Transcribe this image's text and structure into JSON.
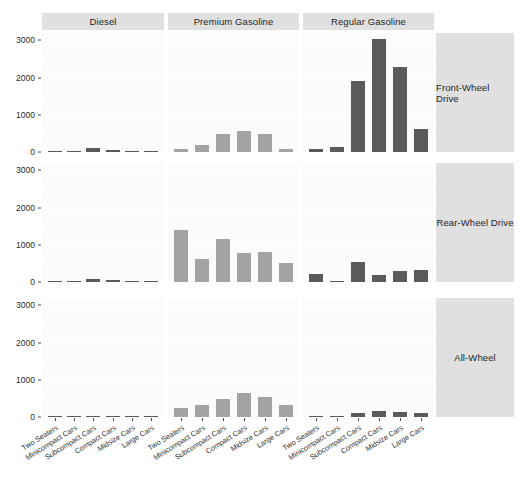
{
  "chart_data": {
    "type": "bar",
    "title": "",
    "xlabel": "",
    "ylabel": "",
    "ylim": [
      0,
      3200
    ],
    "grid": true,
    "legend_position": "none",
    "ytick_labels": [
      "3000",
      "2000",
      "1000",
      "0"
    ],
    "ytick_values": [
      3000,
      2000,
      1000,
      0
    ],
    "categories": [
      "Two Seaters",
      "Minicompact Cars",
      "Subcompact Cars",
      "Compact Cars",
      "Midsize Cars",
      "Large Cars"
    ],
    "col_facets": [
      "Diesel",
      "Premium Gasoline",
      "Regular Gasoline"
    ],
    "row_facets": [
      "Front-Wheel Drive",
      "Rear-Wheel Drive",
      "All-Wheel"
    ],
    "colors": {
      "bar_light": "#a3a3a3",
      "bar_dark": "#5a5a5a",
      "panel_background": "#fbfbfb",
      "strip_background": "#e0e0e0",
      "gridline": "#ffffff",
      "text": "#1f1f1f"
    },
    "panels": [
      {
        "row": "Front-Wheel Drive",
        "col": "Diesel",
        "color": "bar_dark",
        "values": [
          0,
          40,
          120,
          45,
          15,
          0
        ]
      },
      {
        "row": "Front-Wheel Drive",
        "col": "Premium Gasoline",
        "color": "bar_light",
        "values": [
          90,
          200,
          480,
          560,
          480,
          90
        ]
      },
      {
        "row": "Front-Wheel Drive",
        "col": "Regular Gasoline",
        "color": "bar_dark",
        "values": [
          90,
          140,
          1900,
          3050,
          2280,
          630
        ]
      },
      {
        "row": "Rear-Wheel Drive",
        "col": "Diesel",
        "color": "bar_dark",
        "values": [
          0,
          30,
          70,
          60,
          25,
          0
        ]
      },
      {
        "row": "Rear-Wheel Drive",
        "col": "Premium Gasoline",
        "color": "bar_light",
        "values": [
          1410,
          610,
          1170,
          780,
          820,
          510
        ]
      },
      {
        "row": "Rear-Wheel Drive",
        "col": "Regular Gasoline",
        "color": "bar_dark",
        "values": [
          210,
          40,
          540,
          190,
          300,
          310
        ]
      },
      {
        "row": "All-Wheel",
        "col": "Diesel",
        "color": "bar_dark",
        "values": [
          0,
          0,
          0,
          25,
          20,
          0
        ]
      },
      {
        "row": "All-Wheel",
        "col": "Premium Gasoline",
        "color": "bar_light",
        "values": [
          230,
          330,
          480,
          650,
          540,
          310
        ]
      },
      {
        "row": "All-Wheel",
        "col": "Regular Gasoline",
        "color": "bar_dark",
        "values": [
          0,
          20,
          110,
          150,
          140,
          110
        ]
      }
    ]
  }
}
